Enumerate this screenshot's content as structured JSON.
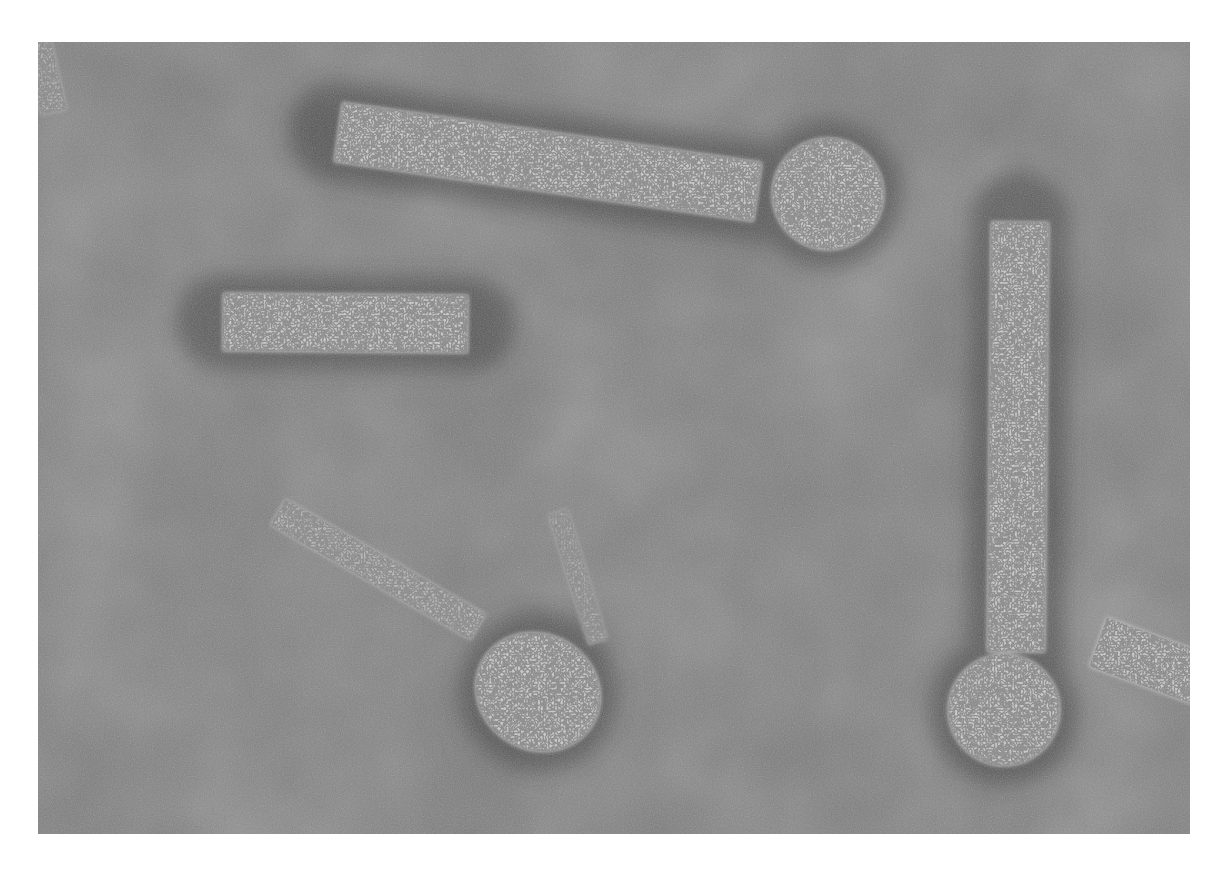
{
  "figure": {
    "type": "electron-micrograph",
    "background_color": "#7a7a7a",
    "particle_color": "#c8c8c8",
    "frame": {
      "x": 38,
      "y": 42,
      "width": 1152,
      "height": 792
    },
    "particles": [
      {
        "id": "top-rod-with-head",
        "rod": {
          "x1": 300,
          "y1": 90,
          "x2": 720,
          "y2": 150,
          "width": 60
        },
        "head": {
          "cx": 790,
          "cy": 152,
          "r": 56
        }
      },
      {
        "id": "short-rod-left",
        "rod": {
          "x1": 185,
          "y1": 280,
          "x2": 430,
          "y2": 282,
          "width": 58
        }
      },
      {
        "id": "right-vertical-rod-with-head",
        "rod": {
          "x1": 982,
          "y1": 180,
          "x2": 978,
          "y2": 610,
          "width": 58
        },
        "head": {
          "cx": 966,
          "cy": 668,
          "r": 56
        }
      },
      {
        "id": "lower-left-rod-with-head",
        "rod": {
          "x1": 240,
          "y1": 470,
          "x2": 440,
          "y2": 585,
          "width": 30
        },
        "head": {
          "cx": 500,
          "cy": 650,
          "r": 62
        }
      },
      {
        "id": "faint-diagonal-fiber",
        "rod": {
          "x1": 520,
          "y1": 470,
          "x2": 560,
          "y2": 600,
          "width": 20
        }
      },
      {
        "id": "partial-rod-right-edge",
        "rod": {
          "x1": 1060,
          "y1": 600,
          "x2": 1170,
          "y2": 640,
          "width": 52
        }
      },
      {
        "id": "partial-rod-left-edge",
        "rod": {
          "x1": 0,
          "y1": 0,
          "x2": 16,
          "y2": 70,
          "width": 26
        }
      }
    ]
  },
  "caption": {
    "text": ""
  }
}
